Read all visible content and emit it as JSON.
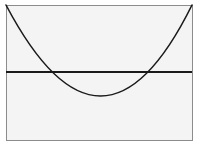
{
  "figure": {
    "kind": "geometry-diagram",
    "title": "",
    "canvas": {
      "width": 199,
      "height": 147,
      "background_color": "#ffffff"
    },
    "frame": {
      "name": "bounding-rectangle",
      "x": 6,
      "y": 5,
      "width": 186,
      "height": 135,
      "stroke_color": "#8c8c8c",
      "stroke_width": 1,
      "fill_color": "#f4f4f4"
    },
    "chord_line": {
      "name": "horizontal-chord",
      "x1": 6,
      "y1": 72,
      "x2": 192,
      "y2": 72,
      "stroke_color": "#1a1a1a",
      "stroke_width": 1.3
    },
    "parabola": {
      "name": "parabola-curve",
      "orientation": "opens-upward",
      "start_point": [
        6,
        5
      ],
      "vertex": [
        102,
        96
      ],
      "end_point": [
        192,
        5
      ],
      "control_point": [
        102,
        187
      ],
      "stroke_color": "#1a1a1a",
      "stroke_width": 1.6,
      "fill": "none"
    },
    "intersections": {
      "name": "chord-parabola-intersections",
      "left": [
        58,
        72
      ],
      "right": [
        147,
        72
      ],
      "count": 2
    }
  },
  "chart_data": {
    "type": "line",
    "title": "",
    "xlabel": "",
    "ylabel": "",
    "grid": false,
    "legend": "none",
    "xlim": [
      6,
      192
    ],
    "ylim": [
      140,
      5
    ],
    "series": [
      {
        "name": "parabola",
        "style": "curve",
        "x": [
          6,
          25,
          44,
          63,
          82,
          102,
          121,
          140,
          159,
          178,
          192
        ],
        "y": [
          5,
          39,
          64,
          81,
          91,
          96,
          91,
          81,
          64,
          39,
          5
        ]
      },
      {
        "name": "horizontal-line",
        "style": "straight",
        "x": [
          6,
          192
        ],
        "y": [
          72,
          72
        ]
      }
    ],
    "annotations": [
      {
        "label": "left intersection",
        "x": 58,
        "y": 72
      },
      {
        "label": "right intersection",
        "x": 147,
        "y": 72
      },
      {
        "label": "vertex",
        "x": 102,
        "y": 96
      }
    ]
  }
}
